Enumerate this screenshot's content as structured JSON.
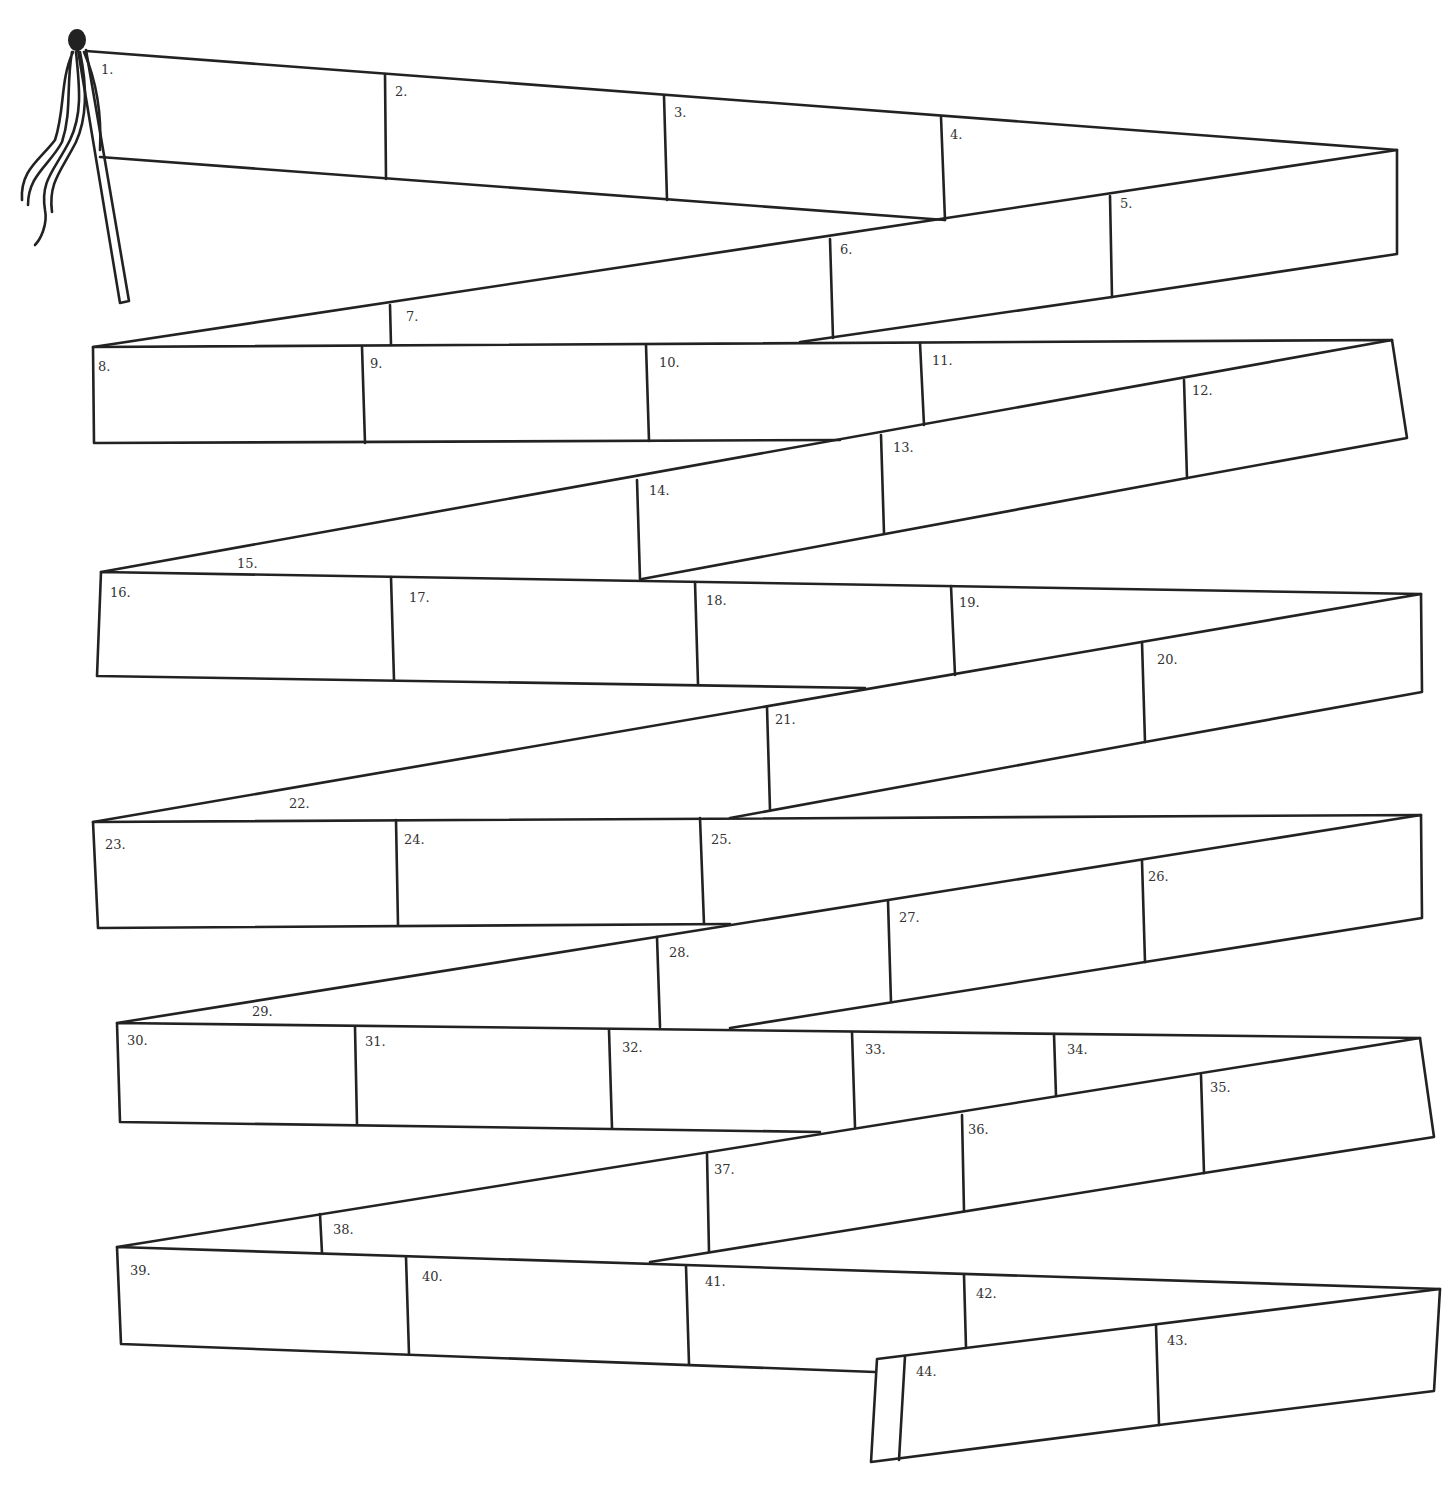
{
  "worksheet": {
    "title": "",
    "stroke_color": "#222222",
    "background": "#ffffff",
    "box_labels": [
      {
        "n": "1.",
        "x": 101,
        "y": 63
      },
      {
        "n": "2.",
        "x": 395,
        "y": 85
      },
      {
        "n": "3.",
        "x": 674,
        "y": 106
      },
      {
        "n": "4.",
        "x": 950,
        "y": 128
      },
      {
        "n": "5.",
        "x": 1120,
        "y": 197
      },
      {
        "n": "6.",
        "x": 840,
        "y": 243
      },
      {
        "n": "7.",
        "x": 406,
        "y": 310
      },
      {
        "n": "8.",
        "x": 98,
        "y": 360
      },
      {
        "n": "9.",
        "x": 370,
        "y": 357
      },
      {
        "n": "10.",
        "x": 659,
        "y": 356
      },
      {
        "n": "11.",
        "x": 932,
        "y": 354
      },
      {
        "n": "12.",
        "x": 1192,
        "y": 384
      },
      {
        "n": "13.",
        "x": 893,
        "y": 441
      },
      {
        "n": "14.",
        "x": 649,
        "y": 484
      },
      {
        "n": "15.",
        "x": 237,
        "y": 557
      },
      {
        "n": "16.",
        "x": 110,
        "y": 586
      },
      {
        "n": "17.",
        "x": 409,
        "y": 591
      },
      {
        "n": "18.",
        "x": 706,
        "y": 594
      },
      {
        "n": "19.",
        "x": 959,
        "y": 596
      },
      {
        "n": "20.",
        "x": 1157,
        "y": 653
      },
      {
        "n": "21.",
        "x": 775,
        "y": 713
      },
      {
        "n": "22.",
        "x": 289,
        "y": 797
      },
      {
        "n": "23.",
        "x": 105,
        "y": 838
      },
      {
        "n": "24.",
        "x": 404,
        "y": 833
      },
      {
        "n": "25.",
        "x": 711,
        "y": 833
      },
      {
        "n": "26.",
        "x": 1148,
        "y": 870
      },
      {
        "n": "27.",
        "x": 899,
        "y": 911
      },
      {
        "n": "28.",
        "x": 669,
        "y": 946
      },
      {
        "n": "29.",
        "x": 252,
        "y": 1005
      },
      {
        "n": "30.",
        "x": 127,
        "y": 1034
      },
      {
        "n": "31.",
        "x": 365,
        "y": 1035
      },
      {
        "n": "32.",
        "x": 622,
        "y": 1041
      },
      {
        "n": "33.",
        "x": 865,
        "y": 1043
      },
      {
        "n": "34.",
        "x": 1067,
        "y": 1043
      },
      {
        "n": "35.",
        "x": 1210,
        "y": 1081
      },
      {
        "n": "36.",
        "x": 968,
        "y": 1123
      },
      {
        "n": "37.",
        "x": 714,
        "y": 1163
      },
      {
        "n": "38.",
        "x": 333,
        "y": 1223
      },
      {
        "n": "39.",
        "x": 130,
        "y": 1264
      },
      {
        "n": "40.",
        "x": 422,
        "y": 1270
      },
      {
        "n": "41.",
        "x": 705,
        "y": 1275
      },
      {
        "n": "42.",
        "x": 976,
        "y": 1287
      },
      {
        "n": "43.",
        "x": 1167,
        "y": 1334
      },
      {
        "n": "44.",
        "x": 916,
        "y": 1365
      }
    ]
  }
}
